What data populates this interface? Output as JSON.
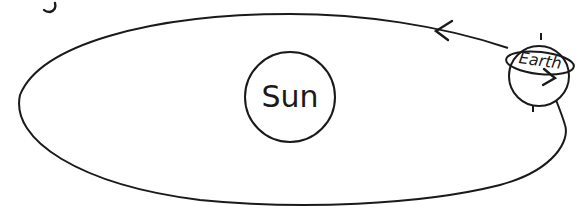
{
  "diagram": {
    "title_fragment": "g",
    "nodes": [
      {
        "id": "sun",
        "label": "Sun"
      },
      {
        "id": "earth",
        "label": "Earth"
      }
    ],
    "orbit": {
      "shape": "ellipse",
      "direction": "counterclockwise"
    },
    "colors": {
      "line": "#1a1a1a",
      "background": "#ffffff"
    }
  }
}
